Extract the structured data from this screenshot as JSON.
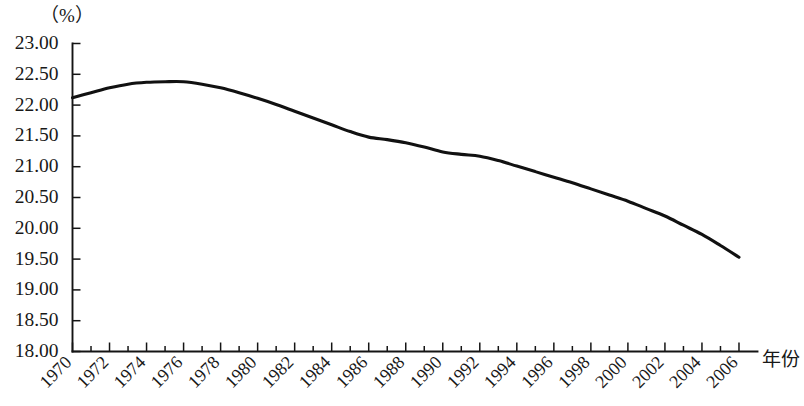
{
  "chart_data": {
    "type": "line",
    "title": "",
    "subtitle": "",
    "xlabel": "年份",
    "ylabel": "（%）",
    "unit_label": "（%）",
    "grid": false,
    "legend": null,
    "legend_position": "none",
    "xlim": [
      1970,
      2007
    ],
    "ylim": [
      18.0,
      23.0
    ],
    "ytick_values": [
      23.0,
      22.5,
      22.0,
      21.5,
      21.0,
      20.5,
      20.0,
      19.5,
      19.0,
      18.5,
      18.0
    ],
    "ytick_labels": [
      "23.00",
      "22.50",
      "22.00",
      "21.50",
      "21.00",
      "20.50",
      "20.00",
      "19.50",
      "19.00",
      "18.50",
      "18.00"
    ],
    "xtick_values": [
      1970,
      1972,
      1974,
      1976,
      1978,
      1980,
      1982,
      1984,
      1986,
      1988,
      1990,
      1992,
      1994,
      1996,
      1998,
      2000,
      2002,
      2004,
      2006
    ],
    "xtick_labels": [
      "1970",
      "1972",
      "1974",
      "1976",
      "1978",
      "1980",
      "1982",
      "1984",
      "1986",
      "1988",
      "1990",
      "1992",
      "1994",
      "1996",
      "1998",
      "2000",
      "2002",
      "2004",
      "2006"
    ],
    "x_minor_step": 1,
    "series": [
      {
        "name": "",
        "color": "#111111",
        "x": [
          1970,
          1971,
          1972,
          1973,
          1974,
          1975,
          1976,
          1977,
          1978,
          1979,
          1980,
          1981,
          1982,
          1983,
          1984,
          1985,
          1986,
          1987,
          1988,
          1989,
          1990,
          1991,
          1992,
          1993,
          1994,
          1995,
          1996,
          1997,
          1998,
          1999,
          2000,
          2001,
          2002,
          2003,
          2004,
          2005,
          2006
        ],
        "values": [
          22.12,
          22.2,
          22.28,
          22.34,
          22.37,
          22.38,
          22.38,
          22.34,
          22.28,
          22.2,
          22.11,
          22.01,
          21.9,
          21.79,
          21.68,
          21.57,
          21.48,
          21.44,
          21.39,
          21.32,
          21.24,
          21.2,
          21.17,
          21.1,
          21.01,
          20.92,
          20.83,
          20.74,
          20.64,
          20.54,
          20.44,
          20.32,
          20.2,
          20.05,
          19.9,
          19.72,
          19.53
        ]
      }
    ]
  }
}
